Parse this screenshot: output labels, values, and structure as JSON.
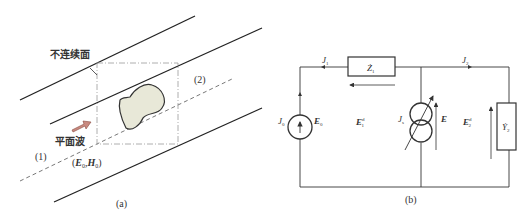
{
  "figure_a": {
    "caption": "(a)",
    "discontinuity_label": "不连续面",
    "plane_wave_label": "平面波",
    "region_1": "(1)",
    "region_2": "(2)",
    "incident_field_E": "E",
    "incident_field_E_sub": "0",
    "incident_field_H": "H",
    "incident_field_H_sub": "0",
    "incident_field_open": "(",
    "incident_field_sep": ",",
    "incident_field_close": ")",
    "colors": {
      "scatterer_fill": "#e8e8d8",
      "arrow_fill": "#c98a80",
      "line": "#222222",
      "box": "#999999"
    }
  },
  "figure_b": {
    "caption": "(b)",
    "J1": "J",
    "J1_sub": "1",
    "J2": "J",
    "J2_sub": "2",
    "J0": "J",
    "J0_sub": "0",
    "Js": "J",
    "Js_sub": "s",
    "Z1": "Ż",
    "Z1_sub": "1",
    "Y2": "Ẏ",
    "Y2_sub": "2",
    "E0": "E",
    "E0_sub": "0",
    "E1d": "E",
    "E1d_sub": "1",
    "E1d_sup": "d",
    "E2d": "E",
    "E2d_sub": "2",
    "E2d_sup": "d",
    "E": "E"
  }
}
